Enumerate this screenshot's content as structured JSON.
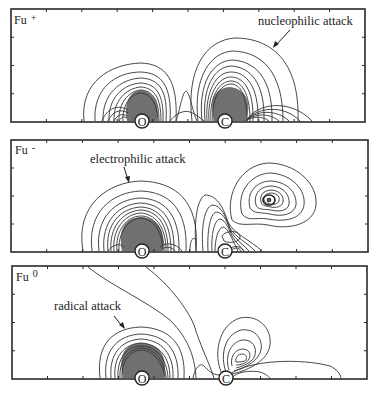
{
  "figure": {
    "panels": [
      {
        "id": "fu-plus",
        "label": "Fu",
        "superscript": "+",
        "annotation": "nucleophilic attack",
        "atoms": [
          {
            "symbol": "O"
          },
          {
            "symbol": "C"
          }
        ]
      },
      {
        "id": "fu-minus",
        "label": "Fu",
        "superscript": "-",
        "annotation": "electrophilic attack",
        "atoms": [
          {
            "symbol": "O"
          },
          {
            "symbol": "C"
          }
        ]
      },
      {
        "id": "fu-zero",
        "label": "Fu",
        "superscript": "0",
        "annotation": "radical attack",
        "atoms": [
          {
            "symbol": "O"
          },
          {
            "symbol": "C"
          }
        ]
      }
    ],
    "colors": {
      "line": "#333333",
      "shade": "#707070",
      "background": "#ffffff"
    }
  }
}
